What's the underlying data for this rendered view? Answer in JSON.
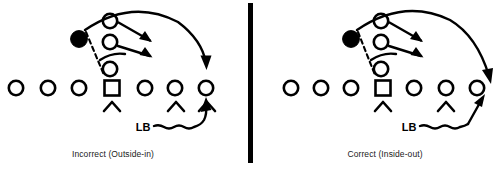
{
  "figure": {
    "background_color": "#ffffff",
    "ink_color": "#000000",
    "divider": {
      "name": "vertical-divider-bar",
      "x": 250,
      "y_top": 3,
      "y_bottom": 163,
      "width": 5,
      "color": "#000000"
    },
    "panels": [
      {
        "id": "left",
        "caption": "Incorrect (Outside-in)",
        "caption_x": 113,
        "caption_y": 157,
        "lb_label": "LB",
        "lb_label_x": 143,
        "lb_label_y": 131,
        "origin_x": 0,
        "defender_chevron_count": 3,
        "lineman_circle_count": 6,
        "center_square_count": 1,
        "back_circle_count": 3,
        "ballcarrier_count": 1,
        "blocking_arrow_count": 2,
        "sweep_arrow_count": 1,
        "pursuit_arrow_count": 1,
        "pursuit_description": "Linebacker runs flat and wide, arriving outside the ballcarrier"
      },
      {
        "id": "right",
        "caption": "Correct (Inside-out)",
        "caption_x": 385,
        "caption_y": 157,
        "lb_label": "LB",
        "lb_label_x": 409,
        "lb_label_y": 131,
        "origin_x": 272,
        "defender_chevron_count": 2,
        "lineman_circle_count": 6,
        "center_square_count": 1,
        "back_circle_count": 3,
        "ballcarrier_count": 1,
        "blocking_arrow_count": 2,
        "sweep_arrow_count": 1,
        "pursuit_arrow_count": 1,
        "pursuit_description": "Linebacker takes a steep angle upfield, cutting off the ballcarrier from the inside"
      }
    ],
    "legend_semantics": {
      "open_circle": "offensive player",
      "open_square": "center",
      "filled_circle": "ballcarrier",
      "chevron": "defensive lineman",
      "dashed_line": "snap / alignment reference",
      "solid_arrow": "blocking assignment",
      "curved_arrow": "ballcarrier sweep path",
      "wavy_line": "linebacker pursuit path"
    }
  }
}
